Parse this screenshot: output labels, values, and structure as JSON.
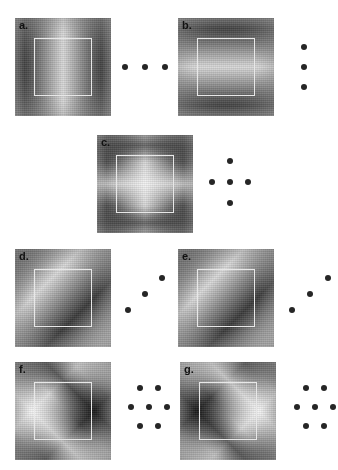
{
  "figure": {
    "background": "#ffffff",
    "dot_color": "#262626",
    "aperture_color": "#e8e8e8",
    "base_gray": "#8a8a8a",
    "panels": [
      {
        "id": "a",
        "label": "a.",
        "stimulus_type": "grating",
        "orientation_deg": 0,
        "orientation_name": "vertical",
        "cycles": 2.0,
        "x": 15,
        "y": 18,
        "w": 96,
        "h": 98,
        "dots": {
          "pattern_name": "horizontal-triplet",
          "count": 3,
          "x": 120,
          "y": 18,
          "w": 70,
          "h": 98,
          "points": [
            [
              5,
              50
            ],
            [
              25,
              50
            ],
            [
              45,
              50
            ]
          ]
        }
      },
      {
        "id": "b",
        "label": "b.",
        "stimulus_type": "grating",
        "orientation_deg": 90,
        "orientation_name": "horizontal",
        "cycles": 2.0,
        "x": 178,
        "y": 18,
        "w": 96,
        "h": 98,
        "dots": {
          "pattern_name": "vertical-triplet",
          "count": 3,
          "x": 284,
          "y": 18,
          "w": 50,
          "h": 98,
          "points": [
            [
              20,
              30
            ],
            [
              20,
              50
            ],
            [
              20,
              70
            ]
          ]
        }
      },
      {
        "id": "c",
        "label": "c.",
        "stimulus_type": "plaid",
        "orientation_deg": 0,
        "orientation_name": "vertical-plus-horizontal",
        "cycles": 2.0,
        "x": 97,
        "y": 135,
        "w": 96,
        "h": 98,
        "dots": {
          "pattern_name": "cross-five",
          "count": 5,
          "x": 200,
          "y": 135,
          "w": 70,
          "h": 98,
          "points": [
            [
              30,
              27
            ],
            [
              12,
              48
            ],
            [
              30,
              48
            ],
            [
              48,
              48
            ],
            [
              30,
              69
            ]
          ]
        }
      },
      {
        "id": "d",
        "label": "d.",
        "stimulus_type": "grating",
        "orientation_deg": 45,
        "orientation_name": "oblique-right",
        "cycles": 2.5,
        "x": 15,
        "y": 249,
        "w": 96,
        "h": 98,
        "dots": {
          "pattern_name": "oblique-triplet",
          "count": 3,
          "x": 118,
          "y": 249,
          "w": 60,
          "h": 98,
          "points": [
            [
              10,
              62
            ],
            [
              27,
              46
            ],
            [
              44,
              30
            ]
          ]
        }
      },
      {
        "id": "e",
        "label": "e.",
        "stimulus_type": "grating",
        "orientation_deg": 45,
        "orientation_name": "oblique-right",
        "cycles": 2.5,
        "x": 178,
        "y": 249,
        "w": 96,
        "h": 98,
        "dots": {
          "pattern_name": "oblique-triplet",
          "count": 3,
          "x": 282,
          "y": 249,
          "w": 56,
          "h": 98,
          "points": [
            [
              10,
              62
            ],
            [
              28,
              46
            ],
            [
              46,
              30
            ]
          ]
        }
      },
      {
        "id": "f",
        "label": "f.",
        "stimulus_type": "plaid",
        "orientation_deg": 45,
        "orientation_name": "oblique-plaid-bright-center",
        "cycles": 2.5,
        "x": 15,
        "y": 362,
        "w": 96,
        "h": 98,
        "dots": {
          "pattern_name": "hexagonal-seven",
          "count": 7,
          "x": 118,
          "y": 362,
          "w": 60,
          "h": 98,
          "points": [
            [
              22,
              27
            ],
            [
              40,
              27
            ],
            [
              13,
              46
            ],
            [
              31,
              46
            ],
            [
              49,
              46
            ],
            [
              22,
              65
            ],
            [
              40,
              65
            ]
          ]
        }
      },
      {
        "id": "g",
        "label": "g.",
        "stimulus_type": "plaid",
        "orientation_deg": 45,
        "orientation_name": "oblique-plaid-dark-center",
        "cycles": 2.5,
        "x": 180,
        "y": 362,
        "w": 96,
        "h": 98,
        "dots": {
          "pattern_name": "hexagonal-seven",
          "count": 7,
          "x": 284,
          "y": 362,
          "w": 54,
          "h": 98,
          "points": [
            [
              22,
              27
            ],
            [
              40,
              27
            ],
            [
              13,
              46
            ],
            [
              31,
              46
            ],
            [
              49,
              46
            ],
            [
              22,
              65
            ],
            [
              40,
              65
            ]
          ]
        }
      }
    ]
  }
}
